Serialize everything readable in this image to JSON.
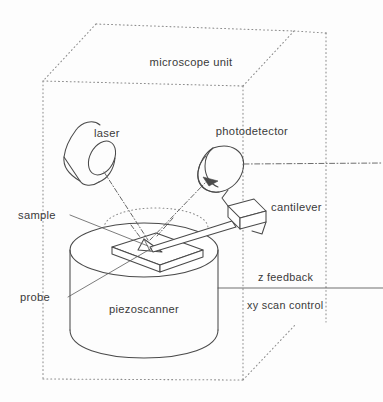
{
  "figure": {
    "kind": "schematic-diagram",
    "background_color": "#fdfdfd",
    "line_color": "#4a4a4a",
    "dotted_color": "#8c8c8c",
    "text_color": "#3a3a3a"
  },
  "labels": {
    "microscope_unit": "microscope unit",
    "laser": "laser",
    "photodetector": "photodetector",
    "sample": "sample",
    "probe": "probe",
    "cantilever": "cantilever",
    "piezoscanner": "piezoscanner",
    "z_feedback": "z feedback",
    "xy_scan_control": "xy scan control"
  },
  "components": {
    "enclosure": "dotted-cube-outline",
    "laser_source": "tilted-cylinder",
    "photodetector_unit": "tilted-cylinder",
    "scanner": "vertical-cylinder",
    "sample_block": "flat-slab",
    "cantilever_beam": "thin-beam",
    "cantilever_holder": "angled-block",
    "probe_tip": "triangular-tip",
    "incident_beam": "dash-dot-ray",
    "reflected_beam": "dash-dot-ray-with-arrow",
    "signal_line": "dash-dot-horizontal",
    "control_line": "solid-horizontal"
  }
}
